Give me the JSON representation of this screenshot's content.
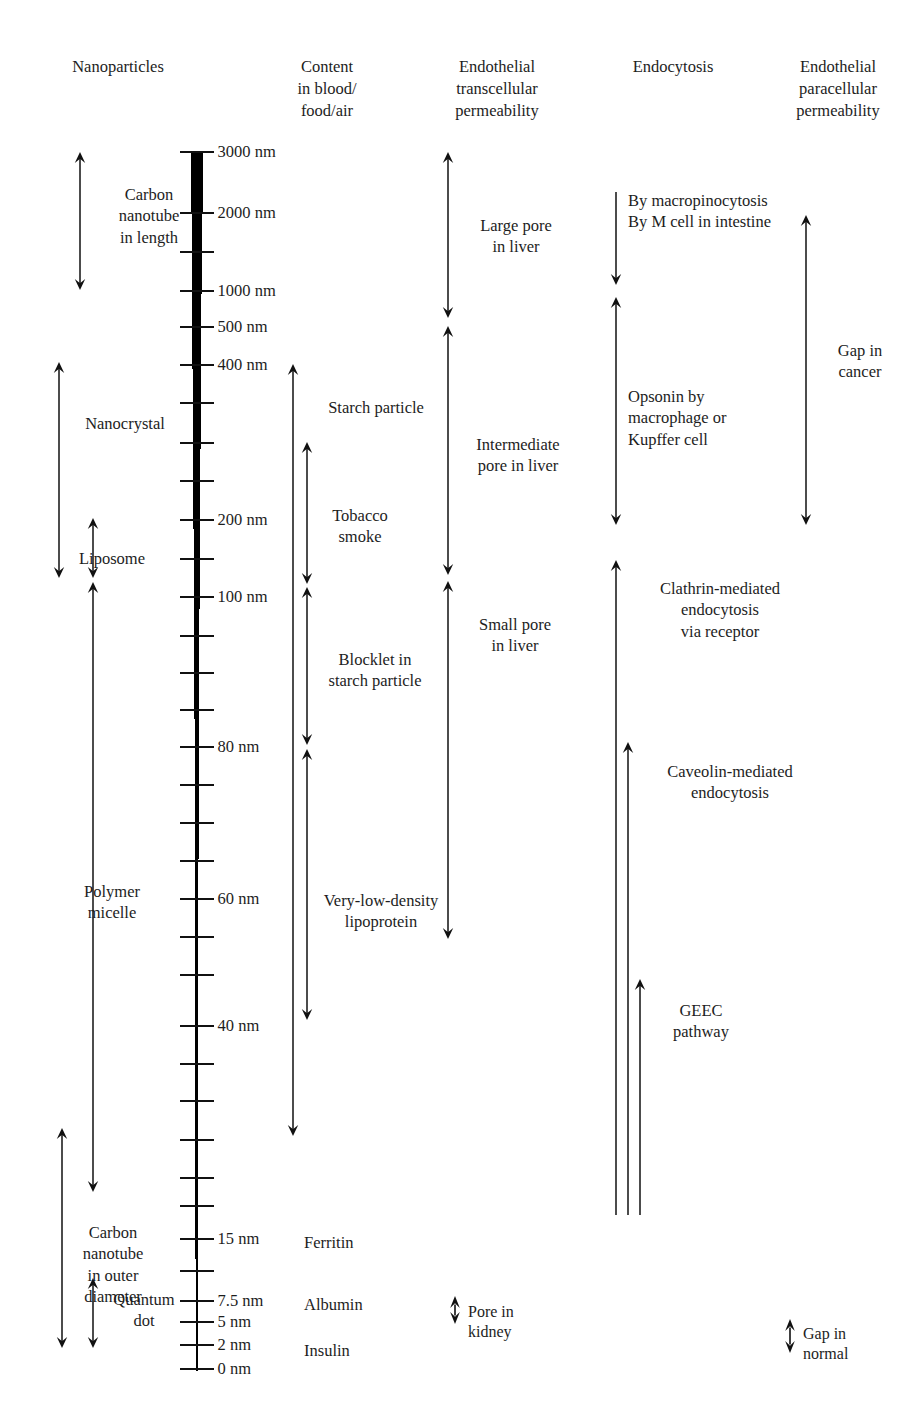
{
  "figure": {
    "width": 919,
    "height": 1409,
    "background": "#ffffff",
    "ink": "#1a1a1a"
  },
  "columns": [
    {
      "id": "nanoparticles",
      "label": "Nanoparticles"
    },
    {
      "id": "content",
      "label": "Content\nin blood/\nfood/air"
    },
    {
      "id": "transcellular",
      "label": "Endothelial\ntranscellular\npermeability"
    },
    {
      "id": "endocytosis",
      "label": "Endocytosis"
    },
    {
      "id": "paracellular",
      "label": "Endothelial\nparacellular\npermeability"
    }
  ],
  "scale": {
    "unit": "nm",
    "labeled_ticks": [
      {
        "value": 3000,
        "label": "3000 nm",
        "y": 152
      },
      {
        "value": 2000,
        "label": "2000 nm",
        "y": 213
      },
      {
        "value": 1000,
        "label": "1000 nm",
        "y": 291
      },
      {
        "value": 500,
        "label": "500 nm",
        "y": 327
      },
      {
        "value": 400,
        "label": "400 nm",
        "y": 365
      },
      {
        "value": 200,
        "label": "200 nm",
        "y": 520
      },
      {
        "value": 100,
        "label": "100 nm",
        "y": 597
      },
      {
        "value": 80,
        "label": "80 nm",
        "y": 747
      },
      {
        "value": 60,
        "label": "60 nm",
        "y": 899
      },
      {
        "value": 40,
        "label": "40 nm",
        "y": 1026
      },
      {
        "value": 15,
        "label": "15 nm",
        "y": 1239
      },
      {
        "value": 7.5,
        "label": "7.5 nm",
        "y": 1301
      },
      {
        "value": 5,
        "label": "5 nm",
        "y": 1322
      },
      {
        "value": 2,
        "label": "2 nm",
        "y": 1345
      },
      {
        "value": 0,
        "label": "0 nm",
        "y": 1369
      }
    ],
    "minor_tick_y": [
      252,
      403,
      443,
      481,
      559,
      636,
      673,
      710,
      785,
      823,
      861,
      937,
      975,
      1064,
      1101,
      1140,
      1178,
      1206,
      1271
    ]
  },
  "nanoparticles": [
    {
      "name": "Carbon nanotube in length",
      "label": "Carbon\nnanotube\nin length",
      "arrow": "double",
      "top": 152,
      "bottom": 290,
      "x": 80,
      "label_x": 95,
      "label_y": 184
    },
    {
      "name": "Nanocrystal",
      "label": "Nanocrystal",
      "arrow": "double",
      "top": 362,
      "bottom": 578,
      "x": 59,
      "label_x": 70,
      "label_y": 413
    },
    {
      "name": "Liposome",
      "label": "Liposome",
      "arrow": "double",
      "top": 518,
      "bottom": 578,
      "x": 93,
      "label_x": 66,
      "label_y": 548
    },
    {
      "name": "Polymer micelle",
      "label": "Polymer\nmicelle",
      "arrow": "double",
      "top": 582,
      "bottom": 1192,
      "x": 93,
      "label_x": 65,
      "label_y": 881
    },
    {
      "name": "Carbon nanotube in outer diameter",
      "label": "Carbon\nnanotube\nin outer\ndiameter",
      "arrow": "double",
      "top": 1128,
      "bottom": 1348,
      "x": 62,
      "label_x": 62,
      "label_y": 1222
    },
    {
      "name": "Quantum dot",
      "label": "Quantum\ndot",
      "arrow": "double",
      "top": 1278,
      "bottom": 1348,
      "x": 93,
      "label_x": 102,
      "label_y": 1289
    }
  ],
  "content": [
    {
      "name": "Starch particle",
      "label": "Starch particle",
      "arrow": "double",
      "top": 364,
      "bottom": 1136,
      "x": 293,
      "label_x": 306,
      "label_y": 397
    },
    {
      "name": "Tobacco smoke",
      "label": "Tobacco\nsmoke",
      "arrow": "double",
      "top": 442,
      "bottom": 584,
      "x": 307,
      "label_x": 316,
      "label_y": 505
    },
    {
      "name": "Blocklet in starch particle",
      "label": "Blocklet in\nstarch particle",
      "arrow": "double",
      "top": 587,
      "bottom": 745,
      "x": 307,
      "label_x": 305,
      "label_y": 649
    },
    {
      "name": "Very-low-density lipoprotein",
      "label": "Very-low-density\nlipoprotein",
      "arrow": "double",
      "top": 749,
      "bottom": 1020,
      "x": 307,
      "label_x": 307,
      "label_y": 890
    },
    {
      "name": "Ferritin",
      "label": "Ferritin",
      "arrow": "none",
      "label_x": 307,
      "label_y": 1232
    },
    {
      "name": "Albumin",
      "label": "Albumin",
      "arrow": "none",
      "label_x": 307,
      "label_y": 1294
    },
    {
      "name": "Insulin",
      "label": "Insulin",
      "arrow": "none",
      "label_x": 307,
      "label_y": 1340
    }
  ],
  "transcellular": [
    {
      "name": "Large pore in liver",
      "label": "Large pore\nin liver",
      "arrow": "double",
      "top": 152,
      "bottom": 318,
      "x": 448,
      "label_x": 460,
      "label_y": 215
    },
    {
      "name": "Intermediate pore in liver",
      "label": "Intermediate\npore in liver",
      "arrow": "double",
      "top": 326,
      "bottom": 575,
      "x": 448,
      "label_x": 455,
      "label_y": 434
    },
    {
      "name": "Small pore in liver",
      "label": "Small pore\nin liver",
      "arrow": "double",
      "top": 581,
      "bottom": 939,
      "x": 448,
      "label_x": 459,
      "label_y": 614
    }
  ],
  "endocytosis": [
    {
      "name": "By macropinocytosis / By M cell in intestine",
      "label": "By macropinocytosis\nBy M cell in intestine",
      "arrow": "down",
      "top": 192,
      "bottom": 285,
      "x": 616,
      "label_x": 630,
      "label_y": 192
    },
    {
      "name": "Opsonin by macrophage or Kupffer cell",
      "label": "Opsonin by\nmacrophage or\nKupffer cell",
      "arrow": "double",
      "top": 297,
      "bottom": 525,
      "x": 616,
      "label_x": 630,
      "label_y": 386
    },
    {
      "name": "Clathrin-mediated endocytosis via receptor",
      "label": "Clathrin-mediated\nendocytosis\nvia receptor",
      "arrow": "up",
      "top": 560,
      "bottom": 1215,
      "x": 616,
      "label_x": 630,
      "label_y": 578
    },
    {
      "name": "Caveolin-mediated endocytosis",
      "label": "Caveolin-mediated\nendocytosis",
      "arrow": "up",
      "top": 742,
      "bottom": 1215,
      "x": 628,
      "label_x": 642,
      "label_y": 761
    },
    {
      "name": "GEEC pathway",
      "label": "GEEC\npathway",
      "arrow": "up",
      "top": 979,
      "bottom": 1215,
      "x": 640,
      "label_x": 654,
      "label_y": 1000
    }
  ],
  "paracellular": [
    {
      "name": "Gap in cancer",
      "label": "Gap in\ncancer",
      "arrow": "double",
      "top": 215,
      "bottom": 525,
      "x": 806,
      "label_x": 818,
      "label_y": 340
    }
  ],
  "legends": [
    {
      "id": "pore-in-kidney",
      "label": "Pore in\nkidney",
      "symbol": "double-arrow-compact",
      "x": 455,
      "y": 1313,
      "label_x": 470,
      "label_y": 1303
    },
    {
      "id": "gap-in-normal",
      "label": "Gap in\nnormal",
      "symbol": "double-arrow-compact",
      "x": 790,
      "y": 1336,
      "label_x": 804,
      "label_y": 1325
    }
  ]
}
